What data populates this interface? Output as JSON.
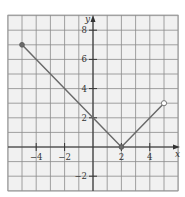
{
  "chart_data": {
    "type": "line",
    "title": "",
    "xlabel": "x",
    "ylabel": "y",
    "xlim": [
      -6,
      6
    ],
    "ylim": [
      -3,
      9
    ],
    "grid": true,
    "grid_step": 1,
    "x_ticks": [
      -4,
      -2,
      2,
      4
    ],
    "x_tick_labels": [
      "-4",
      "-2",
      "2",
      "4"
    ],
    "y_ticks": [
      -2,
      2,
      4,
      6,
      8
    ],
    "y_tick_labels": [
      "-2",
      "2",
      "4",
      "6",
      "8"
    ],
    "series": [
      {
        "name": "piecewise function",
        "points": [
          [
            -5,
            7
          ],
          [
            2,
            0
          ],
          [
            5,
            3
          ]
        ],
        "markers": [
          {
            "x": -5,
            "y": 7,
            "style": "closed"
          },
          {
            "x": 2,
            "y": 0,
            "style": "closed"
          },
          {
            "x": 5,
            "y": 3,
            "style": "open"
          }
        ]
      }
    ],
    "legend": null
  },
  "labels": {
    "x_axis": "x",
    "y_axis": "y"
  }
}
